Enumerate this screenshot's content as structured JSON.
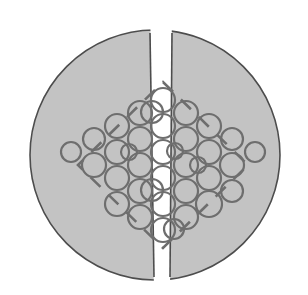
{
  "figure": {
    "canvas": {
      "width": 308,
      "height": 295,
      "background": "#ffffff"
    },
    "specimen": {
      "name": "disc-specimen",
      "shape": "circle",
      "center_x": 155,
      "center_y": 155,
      "radius": 125,
      "fill_color": "#c3c3c3",
      "stroke_color": "#4d4d4d",
      "stroke_width": 1.6,
      "split": {
        "name": "vertical-crack",
        "orientation": "vertical",
        "gap_top_left_x": 150,
        "gap_top_right_x": 172,
        "gap_bottom_left_x": 154,
        "gap_bottom_right_x": 170,
        "gap_color": "#ffffff"
      }
    },
    "roi": {
      "name": "dashed-diamond-region",
      "shape": "rotated-square",
      "center_x": 163,
      "center_y": 165,
      "half_diagonal_x": 85,
      "half_diagonal_y": 83,
      "stroke_color": "#6e6e6e",
      "stroke_width": 2.6,
      "dash_pattern": "14 11"
    },
    "packing": {
      "name": "circle-packing",
      "arrangement": "hexagonal",
      "default_radius": 12,
      "stroke_color": "#6e6e6e",
      "stroke_width": 2.2,
      "fill": "none",
      "circles": [
        {
          "cx": 163,
          "cy": 100,
          "r": 12
        },
        {
          "cx": 186,
          "cy": 113,
          "r": 12
        },
        {
          "cx": 140,
          "cy": 113,
          "r": 12
        },
        {
          "cx": 163,
          "cy": 126,
          "r": 12
        },
        {
          "cx": 209,
          "cy": 126,
          "r": 12
        },
        {
          "cx": 117,
          "cy": 126,
          "r": 12
        },
        {
          "cx": 186,
          "cy": 139,
          "r": 12
        },
        {
          "cx": 140,
          "cy": 139,
          "r": 12
        },
        {
          "cx": 232,
          "cy": 139,
          "r": 11
        },
        {
          "cx": 94,
          "cy": 139,
          "r": 11
        },
        {
          "cx": 163,
          "cy": 152,
          "r": 12
        },
        {
          "cx": 209,
          "cy": 152,
          "r": 12
        },
        {
          "cx": 117,
          "cy": 152,
          "r": 12
        },
        {
          "cx": 255,
          "cy": 152,
          "r": 10
        },
        {
          "cx": 71,
          "cy": 152,
          "r": 10
        },
        {
          "cx": 186,
          "cy": 165,
          "r": 12
        },
        {
          "cx": 140,
          "cy": 165,
          "r": 12
        },
        {
          "cx": 232,
          "cy": 165,
          "r": 12
        },
        {
          "cx": 94,
          "cy": 165,
          "r": 12
        },
        {
          "cx": 163,
          "cy": 178,
          "r": 12
        },
        {
          "cx": 209,
          "cy": 178,
          "r": 12
        },
        {
          "cx": 117,
          "cy": 178,
          "r": 12
        },
        {
          "cx": 186,
          "cy": 191,
          "r": 12
        },
        {
          "cx": 140,
          "cy": 191,
          "r": 12
        },
        {
          "cx": 232,
          "cy": 191,
          "r": 11
        },
        {
          "cx": 163,
          "cy": 204,
          "r": 12
        },
        {
          "cx": 209,
          "cy": 204,
          "r": 13
        },
        {
          "cx": 117,
          "cy": 204,
          "r": 12
        },
        {
          "cx": 186,
          "cy": 217,
          "r": 12
        },
        {
          "cx": 140,
          "cy": 217,
          "r": 12
        },
        {
          "cx": 163,
          "cy": 230,
          "r": 12
        },
        {
          "cx": 152,
          "cy": 112,
          "r": 11
        },
        {
          "cx": 175,
          "cy": 151,
          "r": 8
        },
        {
          "cx": 152,
          "cy": 190,
          "r": 11
        },
        {
          "cx": 174,
          "cy": 229,
          "r": 10
        },
        {
          "cx": 129,
          "cy": 152,
          "r": 8
        },
        {
          "cx": 198,
          "cy": 165,
          "r": 8
        }
      ]
    }
  }
}
